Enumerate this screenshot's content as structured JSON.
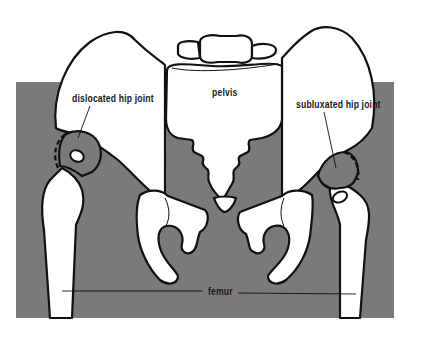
{
  "diagram": {
    "type": "anatomical-illustration",
    "colors": {
      "background": "#ffffff",
      "soft_tissue": "#7a7a7a",
      "bone_fill": "#ffffff",
      "outline": "#111111",
      "label_text": "#1a1a1a"
    },
    "labels": {
      "left_joint": "dislocated hip joint",
      "center": "pelvis",
      "right_joint": "subluxated hip joint",
      "bottom": "femur"
    }
  }
}
